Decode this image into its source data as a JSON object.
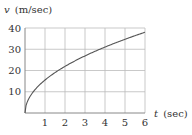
{
  "chart_data": {
    "type": "line",
    "title": "",
    "xlabel": "t (sec)",
    "ylabel": "v (m/sec)",
    "xlabel_var": "t",
    "xlabel_unit": "(sec)",
    "ylabel_var": "v",
    "ylabel_unit": "(m/sec)",
    "xlim": [
      0,
      6
    ],
    "ylim": [
      0,
      40
    ],
    "xticks": [
      "1",
      "2",
      "3",
      "4",
      "5",
      "6"
    ],
    "yticks": [
      "10",
      "20",
      "30",
      "40"
    ],
    "grid": true,
    "legend": null,
    "series": [
      {
        "name": "v(t)",
        "x": [
          0,
          0.25,
          0.5,
          1,
          1.5,
          2,
          2.5,
          3,
          3.5,
          4,
          4.5,
          5,
          5.5,
          6
        ],
        "values": [
          0,
          7.8,
          11,
          15.5,
          19,
          21.9,
          24.5,
          26.8,
          29,
          31,
          32.9,
          34.7,
          36.4,
          38
        ]
      }
    ],
    "colors": {
      "curve": "#555555",
      "grid": "#bbbbbb",
      "axis": "#888888",
      "text": "#333333"
    }
  }
}
